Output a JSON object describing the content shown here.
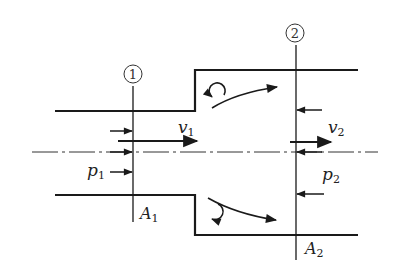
{
  "diagram": {
    "sections": [
      {
        "id": "section-1",
        "marker": "1",
        "area_label": "A",
        "area_sub": "1",
        "velocity_label": "v",
        "velocity_sub": "1",
        "pressure_label": "p",
        "pressure_sub": "1"
      },
      {
        "id": "section-2",
        "marker": "2",
        "area_label": "A",
        "area_sub": "2",
        "velocity_label": "v",
        "velocity_sub": "2",
        "pressure_label": "p",
        "pressure_sub": "2"
      }
    ],
    "colors": {
      "line": "#1a1a1a",
      "background": "#ffffff"
    }
  }
}
